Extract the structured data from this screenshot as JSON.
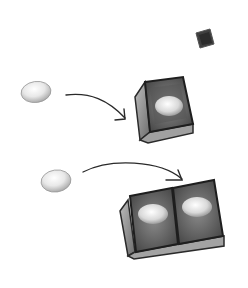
{
  "diagram": {
    "colors": {
      "background": "#ffffff",
      "ink": "#2a2a2a",
      "box_dark": "#4a4a4a",
      "box_mid": "#7a7a7a",
      "box_light": "#a8a8a8",
      "egg_light": "#f2f2f2",
      "egg_shadow": "#b5b5b5"
    },
    "elements": [
      {
        "id": "small-box",
        "type": "box",
        "x": 203,
        "y": 37,
        "size": 12
      },
      {
        "id": "egg-1",
        "type": "egg",
        "cx": 36,
        "cy": 92
      },
      {
        "id": "arrow-1",
        "type": "arrow",
        "from": [
          66,
          95
        ],
        "to": [
          125,
          118
        ]
      },
      {
        "id": "box-1",
        "type": "box-with-egg",
        "eggs": 1
      },
      {
        "id": "egg-2",
        "type": "egg",
        "cx": 56,
        "cy": 181
      },
      {
        "id": "arrow-2",
        "type": "arrow",
        "from": [
          83,
          172
        ],
        "to": [
          182,
          180
        ]
      },
      {
        "id": "box-2",
        "type": "box-with-egg",
        "eggs": 2
      }
    ]
  }
}
